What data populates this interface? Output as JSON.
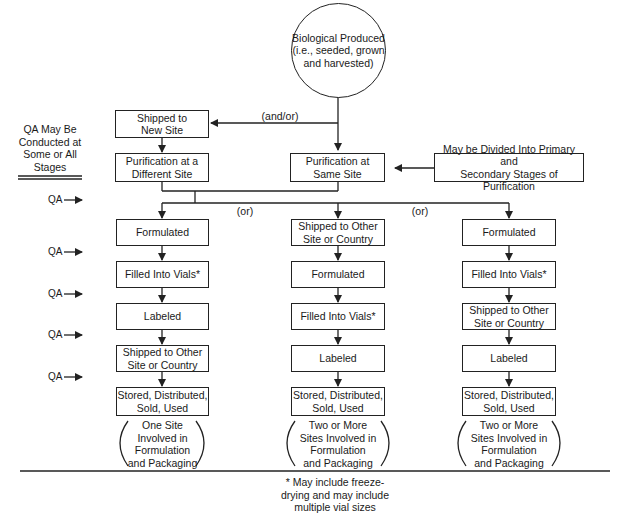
{
  "diagram": {
    "source": {
      "label": "Biological Produced\n(i.e., seeded, grown\nand harvested)"
    },
    "and_or_label": "(and/or)",
    "or_label_1": "(or)",
    "or_label_2": "(or)",
    "qa_note": {
      "label": "QA May Be\nConducted at\nSome or All\nStages"
    },
    "qa_marker": "QA",
    "shipped_new_site": "Shipped to\nNew Site",
    "purification_different": "Purification at a\nDifferent Site",
    "purification_same": "Purification at\nSame Site",
    "purification_note": "May be Divided Into Primary and\nSecondary Stages of Purification",
    "columns": [
      {
        "steps": [
          "Formulated",
          "Filled Into Vials*",
          "Labeled",
          "Shipped to Other\nSite or Country",
          "Stored, Distributed,\nSold, Used"
        ],
        "note": "One Site\nInvolved in\nFormulation\nand Packaging"
      },
      {
        "steps": [
          "Shipped to Other\nSite or Country",
          "Formulated",
          "Filled Into Vials*",
          "Labeled",
          "Stored, Distributed,\nSold, Used"
        ],
        "note": "Two or More\nSites Involved in\nFormulation\nand Packaging"
      },
      {
        "steps": [
          "Formulated",
          "Filled Into Vials*",
          "Shipped to Other\nSite or Country",
          "Labeled",
          "Stored, Distributed,\nSold, Used"
        ],
        "note": "Two or More\nSites Involved in\nFormulation\nand Packaging"
      }
    ],
    "footnote": "* May include freeze-\ndrying and may include\nmultiple vial sizes"
  }
}
